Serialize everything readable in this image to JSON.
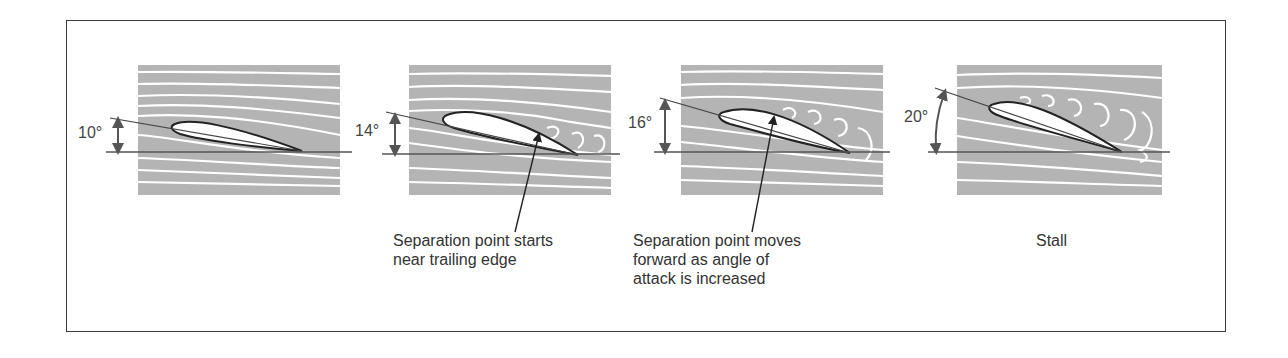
{
  "diagram": {
    "panels": [
      {
        "angle_label": "10°",
        "angle_deg": 10,
        "state": "attached-flow"
      },
      {
        "angle_label": "14°",
        "angle_deg": 14,
        "state": "separation-near-trailing-edge"
      },
      {
        "angle_label": "16°",
        "angle_deg": 16,
        "state": "separation-moves-forward"
      },
      {
        "angle_label": "20°",
        "angle_deg": 20,
        "state": "stall"
      }
    ],
    "captions": [
      {
        "text": "Separation point starts\nnear trailing edge"
      },
      {
        "text": "Separation point moves\nforward as angle of\nattack is increased"
      },
      {
        "text": "Stall"
      }
    ],
    "colors": {
      "flow_background": "#b4b4b4",
      "streamline": "#ffffff",
      "airfoil_outline": "#222222",
      "frame": "#3a3a3a"
    }
  }
}
